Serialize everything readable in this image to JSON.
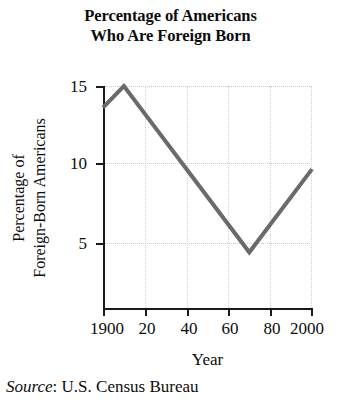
{
  "title": {
    "line1": "Percentage of Americans",
    "line2": "Who Are Foreign Born"
  },
  "axis_title_y": {
    "line1": "Percentage of",
    "line2": "Foreign-Born Americans"
  },
  "axis_title_x": "Year",
  "source": {
    "label": "Source",
    "separator": ":",
    "value": "U.S. Census Bureau",
    "full": "Source: U.S. Census Bureau"
  },
  "y_ticks": [
    "5",
    "10",
    "15"
  ],
  "x_ticks": [
    "1900",
    "20",
    "40",
    "60",
    "80",
    "2000"
  ],
  "colors": {
    "line": "#6a6a6a",
    "axis": "#1a1a1a",
    "grid": "#c9c9c9",
    "text": "#0d0d0d",
    "background": "#ffffff"
  },
  "chart_data": {
    "type": "line",
    "title": "Percentage of Americans Who Are Foreign Born",
    "xlabel": "Year",
    "ylabel": "Percentage of Foreign-Born Americans",
    "source": "Source: U.S. Census Bureau",
    "xlim": [
      1900,
      2000
    ],
    "ylim": [
      0,
      16.5
    ],
    "xticks": [
      1900,
      1920,
      1940,
      1960,
      1980,
      2000
    ],
    "xticklabels": [
      "1900",
      "20",
      "40",
      "60",
      "80",
      "2000"
    ],
    "yticks": [
      5,
      10,
      15
    ],
    "yticklabels": [
      "5",
      "10",
      "15"
    ],
    "grid": true,
    "grid_style": "dotted",
    "legend": false,
    "line_color": "#6a6a6a",
    "line_width": 4,
    "series": [
      {
        "name": "Percentage of Foreign-Born Americans",
        "x": [
          1900,
          1910,
          1970,
          2000
        ],
        "values": [
          13.6,
          15.0,
          4.2,
          9.6
        ]
      }
    ]
  }
}
